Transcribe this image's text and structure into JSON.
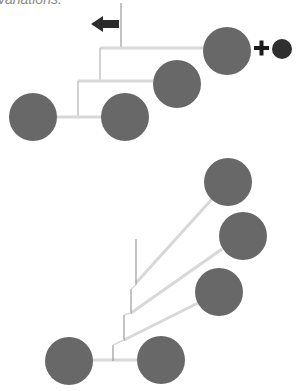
{
  "caption": "variations.",
  "colors": {
    "node": "#686868",
    "small_node": "#2f2f2f",
    "branch": "#d8d8d8",
    "stem": "#9a9a9a",
    "arrow": "#2b2b2b",
    "plus": "#1a1a1a"
  },
  "symbols": {
    "plus": "+",
    "arrow": "left-arrow"
  },
  "top_tree": {
    "nodes": [
      {
        "id": "A",
        "cx": 227,
        "cy": 51,
        "r": 24
      },
      {
        "id": "B",
        "cx": 177,
        "cy": 84,
        "r": 24
      },
      {
        "id": "C",
        "cx": 33,
        "cy": 117,
        "r": 24
      },
      {
        "id": "D",
        "cx": 125,
        "cy": 117,
        "r": 24
      }
    ],
    "added_node": {
      "cx": 282,
      "cy": 49,
      "r": 10
    }
  },
  "bottom_tree": {
    "nodes": [
      {
        "id": "E",
        "cx": 228,
        "cy": 182,
        "r": 24
      },
      {
        "id": "F",
        "cx": 243,
        "cy": 236,
        "r": 24
      },
      {
        "id": "G",
        "cx": 219,
        "cy": 292,
        "r": 24
      },
      {
        "id": "H",
        "cx": 69,
        "cy": 361,
        "r": 24
      },
      {
        "id": "I",
        "cx": 161,
        "cy": 360,
        "r": 24
      }
    ]
  }
}
